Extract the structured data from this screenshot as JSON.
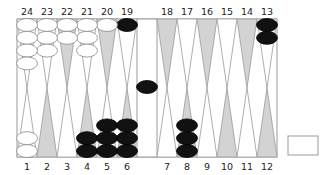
{
  "board": {
    "top_labels": [
      "24",
      "23",
      "22",
      "21",
      "20",
      "19",
      "18",
      "17",
      "16",
      "15",
      "14",
      "13"
    ],
    "bottom_labels": [
      "1",
      "2",
      "3",
      "4",
      "5",
      "6",
      "7",
      "8",
      "9",
      "10",
      "11",
      "12"
    ],
    "colors": {
      "frame": "#999999",
      "point_light": "#ffffff",
      "point_dark": "#d3d3d3",
      "checker_white": "#ffffff",
      "checker_black": "#111111",
      "checker_outline": "#888888"
    },
    "points": [
      {
        "n": 1,
        "color": "white",
        "count": 2
      },
      {
        "n": 2,
        "color": null,
        "count": 0
      },
      {
        "n": 3,
        "color": null,
        "count": 0
      },
      {
        "n": 4,
        "color": "black",
        "count": 2
      },
      {
        "n": 5,
        "color": "black",
        "count": 3
      },
      {
        "n": 6,
        "color": "black",
        "count": 3
      },
      {
        "n": 7,
        "color": null,
        "count": 0
      },
      {
        "n": 8,
        "color": "black",
        "count": 3
      },
      {
        "n": 9,
        "color": null,
        "count": 0
      },
      {
        "n": 10,
        "color": null,
        "count": 0
      },
      {
        "n": 11,
        "color": null,
        "count": 0
      },
      {
        "n": 12,
        "color": null,
        "count": 0
      },
      {
        "n": 13,
        "color": "black",
        "count": 2
      },
      {
        "n": 14,
        "color": null,
        "count": 0
      },
      {
        "n": 15,
        "color": null,
        "count": 0
      },
      {
        "n": 16,
        "color": null,
        "count": 0
      },
      {
        "n": 17,
        "color": null,
        "count": 0
      },
      {
        "n": 18,
        "color": null,
        "count": 0
      },
      {
        "n": 19,
        "color": "black",
        "count": 1
      },
      {
        "n": 20,
        "color": "white",
        "count": 1
      },
      {
        "n": 21,
        "color": "white",
        "count": 3
      },
      {
        "n": 22,
        "color": "white",
        "count": 2
      },
      {
        "n": 23,
        "color": "white",
        "count": 3
      },
      {
        "n": 24,
        "color": "white",
        "count": 4
      }
    ],
    "bar": {
      "black": 1,
      "white": 0
    },
    "dice_box": {
      "visible": true,
      "value": ""
    }
  }
}
